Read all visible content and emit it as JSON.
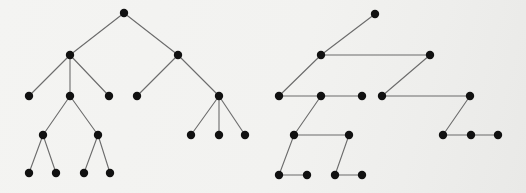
{
  "figure": {
    "title": "",
    "background_color": "#f2f2f0",
    "node_color": "#111111",
    "edge_color": "#6b6b6b",
    "node_radius": 4.2,
    "edge_width": 1.1,
    "width": 526,
    "height": 193
  },
  "chart_data": {
    "type": "diagram",
    "diagram_kind": "node-link-graph-pair",
    "title": "",
    "xlabel": "",
    "ylabel": "",
    "grid": false,
    "legend": null,
    "axis_ranges": {
      "x": [
        0,
        526
      ],
      "y": [
        0,
        193
      ]
    },
    "graphs": [
      {
        "name": "left-rooted-tree",
        "layout": "hierarchical-tree",
        "levels": [
          13,
          55,
          96,
          135,
          173
        ],
        "node_count": 18,
        "edge_count": 17,
        "nodes": [
          {
            "id": "L0",
            "x": 124,
            "y": 13,
            "level": 0,
            "label": ""
          },
          {
            "id": "L1",
            "x": 70,
            "y": 55,
            "level": 1,
            "label": ""
          },
          {
            "id": "L2",
            "x": 178,
            "y": 55,
            "level": 1,
            "label": ""
          },
          {
            "id": "L3",
            "x": 29,
            "y": 96,
            "level": 2,
            "label": ""
          },
          {
            "id": "L4",
            "x": 70,
            "y": 96,
            "level": 2,
            "label": ""
          },
          {
            "id": "L5",
            "x": 109,
            "y": 96,
            "level": 2,
            "label": ""
          },
          {
            "id": "L6",
            "x": 137,
            "y": 96,
            "level": 2,
            "label": ""
          },
          {
            "id": "L7",
            "x": 219,
            "y": 96,
            "level": 2,
            "label": ""
          },
          {
            "id": "L8",
            "x": 43,
            "y": 135,
            "level": 3,
            "label": ""
          },
          {
            "id": "L9",
            "x": 98,
            "y": 135,
            "level": 3,
            "label": ""
          },
          {
            "id": "L10",
            "x": 191,
            "y": 135,
            "level": 3,
            "label": ""
          },
          {
            "id": "L11",
            "x": 219,
            "y": 135,
            "level": 3,
            "label": ""
          },
          {
            "id": "L12",
            "x": 245,
            "y": 135,
            "level": 3,
            "label": ""
          },
          {
            "id": "L13",
            "x": 29,
            "y": 173,
            "level": 4,
            "label": ""
          },
          {
            "id": "L14",
            "x": 56,
            "y": 173,
            "level": 4,
            "label": ""
          },
          {
            "id": "L15",
            "x": 84,
            "y": 173,
            "level": 4,
            "label": ""
          },
          {
            "id": "L16",
            "x": 110,
            "y": 173,
            "level": 4,
            "label": ""
          }
        ],
        "edges": [
          [
            "L0",
            "L1"
          ],
          [
            "L0",
            "L2"
          ],
          [
            "L1",
            "L3"
          ],
          [
            "L1",
            "L4"
          ],
          [
            "L1",
            "L5"
          ],
          [
            "L2",
            "L6"
          ],
          [
            "L2",
            "L7"
          ],
          [
            "L4",
            "L8"
          ],
          [
            "L4",
            "L9"
          ],
          [
            "L7",
            "L10"
          ],
          [
            "L7",
            "L11"
          ],
          [
            "L7",
            "L12"
          ],
          [
            "L8",
            "L13"
          ],
          [
            "L8",
            "L14"
          ],
          [
            "L9",
            "L15"
          ],
          [
            "L9",
            "L16"
          ]
        ]
      },
      {
        "name": "right-path-graph",
        "layout": "zigzag-paths",
        "levels": [
          14,
          55,
          96,
          135,
          175
        ],
        "node_count": 17,
        "edge_count": 13,
        "nodes": [
          {
            "id": "R0",
            "x": 375,
            "y": 14,
            "level": 0,
            "label": ""
          },
          {
            "id": "R1",
            "x": 321,
            "y": 55,
            "level": 1,
            "label": ""
          },
          {
            "id": "R2",
            "x": 430,
            "y": 55,
            "level": 1,
            "label": ""
          },
          {
            "id": "R3",
            "x": 279,
            "y": 96,
            "level": 2,
            "label": ""
          },
          {
            "id": "R4",
            "x": 321,
            "y": 96,
            "level": 2,
            "label": ""
          },
          {
            "id": "R5",
            "x": 362,
            "y": 96,
            "level": 2,
            "label": ""
          },
          {
            "id": "R6",
            "x": 382,
            "y": 96,
            "level": 2,
            "label": ""
          },
          {
            "id": "R7",
            "x": 470,
            "y": 96,
            "level": 2,
            "label": ""
          },
          {
            "id": "R8",
            "x": 294,
            "y": 135,
            "level": 3,
            "label": ""
          },
          {
            "id": "R9",
            "x": 349,
            "y": 135,
            "level": 3,
            "label": ""
          },
          {
            "id": "R10",
            "x": 443,
            "y": 135,
            "level": 3,
            "label": ""
          },
          {
            "id": "R11",
            "x": 471,
            "y": 135,
            "level": 3,
            "label": ""
          },
          {
            "id": "R12",
            "x": 498,
            "y": 135,
            "level": 3,
            "label": ""
          },
          {
            "id": "R13",
            "x": 279,
            "y": 175,
            "level": 4,
            "label": ""
          },
          {
            "id": "R14",
            "x": 307,
            "y": 175,
            "level": 4,
            "label": ""
          },
          {
            "id": "R15",
            "x": 335,
            "y": 175,
            "level": 4,
            "label": ""
          },
          {
            "id": "R16",
            "x": 362,
            "y": 175,
            "level": 4,
            "label": ""
          }
        ],
        "edges": [
          [
            "R0",
            "R1"
          ],
          [
            "R1",
            "R2"
          ],
          [
            "R1",
            "R3"
          ],
          [
            "R3",
            "R4"
          ],
          [
            "R4",
            "R5"
          ],
          [
            "R2",
            "R6"
          ],
          [
            "R6",
            "R7"
          ],
          [
            "R4",
            "R8"
          ],
          [
            "R8",
            "R9"
          ],
          [
            "R7",
            "R10"
          ],
          [
            "R10",
            "R11"
          ],
          [
            "R11",
            "R12"
          ],
          [
            "R8",
            "R13"
          ],
          [
            "R13",
            "R14"
          ],
          [
            "R9",
            "R15"
          ],
          [
            "R15",
            "R16"
          ]
        ]
      }
    ]
  }
}
